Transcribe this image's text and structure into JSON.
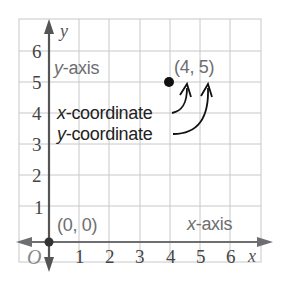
{
  "diagram": {
    "colors": {
      "grid": "#c8c8c8",
      "axis": "#555555",
      "axis_arrow": "#6d6e71",
      "point": "#111111",
      "label_gray": "#6d6e71",
      "label_dark": "#222222"
    },
    "axes": {
      "x_label": "x",
      "y_label": "y",
      "origin_label": "O",
      "x_ticks": [
        "1",
        "2",
        "3",
        "4",
        "5",
        "6"
      ],
      "y_ticks": [
        "1",
        "2",
        "3",
        "4",
        "5",
        "6"
      ]
    },
    "labels": {
      "y_axis_prefix": "y",
      "y_axis_suffix": "-axis",
      "x_axis_prefix": "x",
      "x_axis_suffix": "-axis",
      "origin_point": "(0, 0)",
      "point": "(4, 5)",
      "x_coordinate_prefix": "x",
      "x_coordinate_suffix": "-coordinate",
      "y_coordinate_prefix": "y",
      "y_coordinate_suffix": "-coordinate"
    },
    "points": [
      {
        "name": "origin",
        "x": 0,
        "y": 0,
        "label": "(0, 0)"
      },
      {
        "name": "P",
        "x": 4,
        "y": 5,
        "label": "(4, 5)"
      }
    ]
  }
}
